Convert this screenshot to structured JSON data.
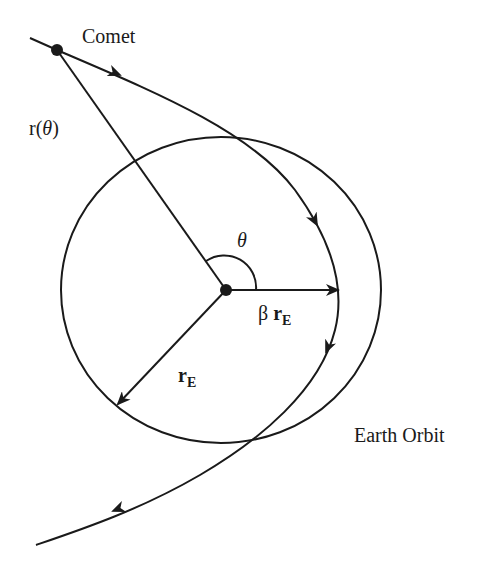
{
  "diagram": {
    "labels": {
      "comet": "Comet",
      "r_theta_prefix": "r(",
      "r_theta_var": "θ",
      "r_theta_suffix": ")",
      "theta": "θ",
      "beta_symbol": "β",
      "beta_r": "r",
      "beta_sub": "E",
      "rE_r": "r",
      "rE_sub": "E",
      "earth_orbit": "Earth Orbit"
    },
    "colors": {
      "stroke": "#1a1a1a",
      "background": "#ffffff"
    },
    "geometry": {
      "sun_center": [
        226,
        290
      ],
      "earth_orbit_radius": 158,
      "comet_position": [
        57,
        50
      ],
      "perihelion_point": [
        340,
        290
      ]
    }
  }
}
